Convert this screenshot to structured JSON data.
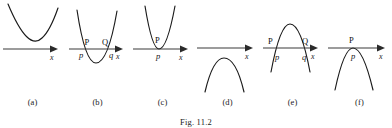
{
  "figure": {
    "caption": "Fig. 11.2",
    "axis_label": "x",
    "panels": [
      {
        "id": "a",
        "sublabel": "(a)",
        "orientation": "upward",
        "roots": "none",
        "description": "upward parabola lying entirely above the x-axis",
        "point_labels_upper": [],
        "point_labels_lower": [],
        "axis_label": "x"
      },
      {
        "id": "b",
        "sublabel": "(b)",
        "orientation": "upward",
        "roots": "two",
        "description": "upward parabola cutting the x-axis at two points P and Q",
        "point_labels_upper": [
          "P",
          "Q"
        ],
        "point_labels_lower": [
          "p",
          "q"
        ],
        "axis_label": "x"
      },
      {
        "id": "c",
        "sublabel": "(c)",
        "orientation": "upward",
        "roots": "one",
        "description": "upward parabola touching the x-axis at a single point P",
        "point_labels_upper": [
          "P"
        ],
        "point_labels_lower": [
          "p"
        ],
        "axis_label": "x"
      },
      {
        "id": "d",
        "sublabel": "(d)",
        "orientation": "downward",
        "roots": "none",
        "description": "downward parabola lying entirely below the x-axis",
        "point_labels_upper": [],
        "point_labels_lower": [],
        "axis_label": "x"
      },
      {
        "id": "e",
        "sublabel": "(e)",
        "orientation": "downward",
        "roots": "two",
        "description": "downward parabola cutting the x-axis at two points P and Q",
        "point_labels_upper": [
          "P",
          "Q"
        ],
        "point_labels_lower": [
          "p",
          "q"
        ],
        "axis_label": "x"
      },
      {
        "id": "f",
        "sublabel": "(f)",
        "orientation": "downward",
        "roots": "one",
        "description": "downward parabola touching the x-axis at a single point P",
        "point_labels_upper": [
          "P"
        ],
        "point_labels_lower": [
          "p"
        ],
        "axis_label": "x"
      }
    ]
  },
  "colors": {
    "curve": "#1a1a1a",
    "axis": "#3a3a3a",
    "background": "#ffffff",
    "text": "#111111"
  }
}
